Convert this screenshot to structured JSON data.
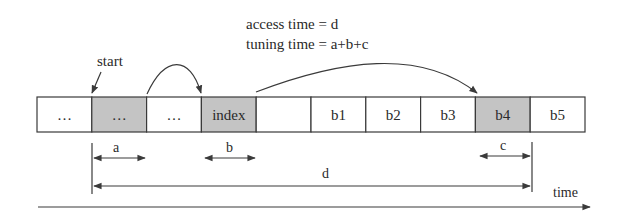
{
  "annotations": {
    "access_time": "access time = d",
    "tuning_time": "tuning time = a+b+c",
    "start": "start",
    "time_axis": "time"
  },
  "cells": [
    {
      "label": "…",
      "shaded": false
    },
    {
      "label": "…",
      "shaded": true
    },
    {
      "label": "…",
      "shaded": false
    },
    {
      "label": "index",
      "shaded": true
    },
    {
      "label": "",
      "shaded": false
    },
    {
      "label": "b1",
      "shaded": false
    },
    {
      "label": "b2",
      "shaded": false
    },
    {
      "label": "b3",
      "shaded": false
    },
    {
      "label": "b4",
      "shaded": true
    },
    {
      "label": "b5",
      "shaded": false
    }
  ],
  "intervals": {
    "a": "a",
    "b": "b",
    "c": "c",
    "d": "d"
  },
  "colors": {
    "shaded": "#c4c4c4",
    "unshaded": "#ffffff",
    "line": "#3a3a3a"
  }
}
